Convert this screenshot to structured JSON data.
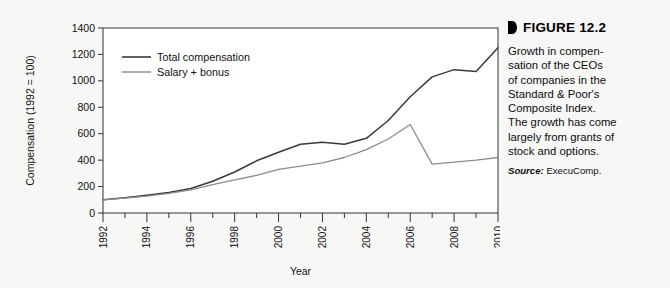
{
  "figure": {
    "marker_icon": "triangle-right-icon",
    "title": "FIGURE 12.2",
    "body_lines": [
      "Growth in compen-",
      "sation of the CEOs",
      "of companies in the",
      "Standard & Poor's",
      "Composite Index.",
      "The growth has come",
      "largely from grants of",
      "stock and options."
    ],
    "source_label": "Source:",
    "source_value": "ExecuComp."
  },
  "colors": {
    "background": "#f7f7f6",
    "plot_background": "#ffffff",
    "axis": "#333333",
    "total_compensation": "#3a3a3a",
    "salary_bonus": "#8c8c8c",
    "text": "#111111"
  },
  "chart_data": {
    "type": "line",
    "title": "",
    "xlabel": "Year",
    "ylabel": "Compensation (1992 = 100)",
    "xlim": [
      1992,
      2010
    ],
    "ylim": [
      0,
      1400
    ],
    "yticks": [
      0,
      200,
      400,
      600,
      800,
      1000,
      1200,
      1400
    ],
    "xticks_major": [
      1992,
      1994,
      1996,
      1998,
      2000,
      2002,
      2004,
      2006,
      2008,
      2010
    ],
    "xticks_minor": [
      1993,
      1995,
      1997,
      1999,
      2001,
      2003,
      2005,
      2007,
      2009
    ],
    "grid": false,
    "legend_position": "top-left",
    "x": [
      1992,
      1993,
      1994,
      1995,
      1996,
      1997,
      1998,
      1999,
      2000,
      2001,
      2002,
      2003,
      2004,
      2005,
      2006,
      2007,
      2008,
      2009,
      2010
    ],
    "series": [
      {
        "name": "Total compensation",
        "color": "#3a3a3a",
        "values": [
          100,
          115,
          135,
          155,
          185,
          240,
          310,
          395,
          460,
          520,
          535,
          520,
          565,
          700,
          880,
          1030,
          1085,
          1070,
          1250
        ]
      },
      {
        "name": "Salary + bonus",
        "color": "#8c8c8c",
        "values": [
          100,
          112,
          128,
          148,
          175,
          215,
          250,
          285,
          330,
          355,
          380,
          420,
          480,
          560,
          670,
          370,
          385,
          400,
          420
        ]
      }
    ]
  }
}
